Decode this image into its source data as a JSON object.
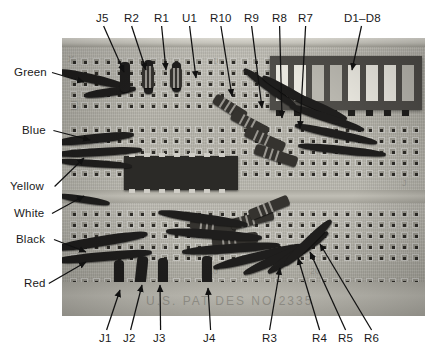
{
  "figure": {
    "kind": "annotated-photograph",
    "board_emboss_text": "U.S. PAT DES NO 2335"
  },
  "labels": {
    "top": [
      {
        "text": "J5",
        "x": 96,
        "y": 12,
        "tip_x": 124,
        "tip_y": 72
      },
      {
        "text": "R2",
        "x": 124,
        "y": 12,
        "tip_x": 146,
        "tip_y": 70
      },
      {
        "text": "R1",
        "x": 154,
        "y": 12,
        "tip_x": 166,
        "tip_y": 70
      },
      {
        "text": "U1",
        "x": 182,
        "y": 12,
        "tip_x": 196,
        "tip_y": 78
      },
      {
        "text": "R10",
        "x": 210,
        "y": 12,
        "tip_x": 232,
        "tip_y": 96
      },
      {
        "text": "R9",
        "x": 244,
        "y": 12,
        "tip_x": 262,
        "tip_y": 108
      },
      {
        "text": "R8",
        "x": 272,
        "y": 12,
        "tip_x": 282,
        "tip_y": 118
      },
      {
        "text": "R7",
        "x": 298,
        "y": 12,
        "tip_x": 300,
        "tip_y": 128
      },
      {
        "text": "D1–D8",
        "x": 344,
        "y": 12,
        "tip_x": 352,
        "tip_y": 70
      }
    ],
    "left": [
      {
        "text": "Green",
        "x": 14,
        "y": 66,
        "tip_x": 84,
        "tip_y": 82
      },
      {
        "text": "Blue",
        "x": 22,
        "y": 124,
        "tip_x": 90,
        "tip_y": 140
      },
      {
        "text": "Yellow",
        "x": 10,
        "y": 180,
        "tip_x": 84,
        "tip_y": 158
      },
      {
        "text": "White",
        "x": 14,
        "y": 207,
        "tip_x": 84,
        "tip_y": 196
      },
      {
        "text": "Black",
        "x": 16,
        "y": 233,
        "tip_x": 86,
        "tip_y": 252
      },
      {
        "text": "Red",
        "x": 24,
        "y": 277,
        "tip_x": 86,
        "tip_y": 262
      }
    ],
    "bottom": [
      {
        "text": "J1",
        "x": 99,
        "y": 332,
        "tip_x": 120,
        "tip_y": 290
      },
      {
        "text": "J2",
        "x": 123,
        "y": 332,
        "tip_x": 142,
        "tip_y": 285
      },
      {
        "text": "J3",
        "x": 153,
        "y": 332,
        "tip_x": 160,
        "tip_y": 285
      },
      {
        "text": "J4",
        "x": 203,
        "y": 332,
        "tip_x": 208,
        "tip_y": 288
      },
      {
        "text": "R3",
        "x": 262,
        "y": 332,
        "tip_x": 280,
        "tip_y": 268
      },
      {
        "text": "R4",
        "x": 312,
        "y": 332,
        "tip_x": 298,
        "tip_y": 258
      },
      {
        "text": "R5",
        "x": 338,
        "y": 332,
        "tip_x": 310,
        "tip_y": 252
      },
      {
        "text": "R6",
        "x": 364,
        "y": 332,
        "tip_x": 320,
        "tip_y": 244
      }
    ]
  },
  "colors": {
    "background": "#ffffff",
    "label_text": "#1a1a1a",
    "leader_line": "#111111",
    "board_body": "#b9b7ae",
    "board_hole": "#2e2c28",
    "ic_body": "#2b2a27",
    "led_bar_body": "#4e4c48",
    "led_segment": "#e9e7df",
    "wire": "#1f1e1d"
  }
}
